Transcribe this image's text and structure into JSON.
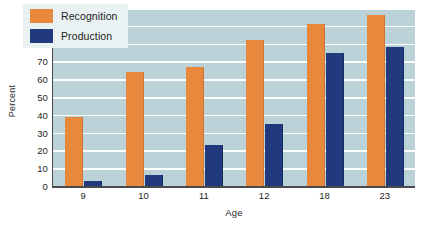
{
  "chart_data": {
    "type": "bar",
    "title": "",
    "xlabel": "Age",
    "ylabel": "Percent",
    "categories": [
      "9",
      "10",
      "11",
      "12",
      "18",
      "23"
    ],
    "series": [
      {
        "name": "Recognition",
        "color": "#e8883c",
        "values": [
          39,
          64,
          67,
          82,
          91,
          96
        ]
      },
      {
        "name": "Production",
        "color": "#21397d",
        "values": [
          3,
          6,
          23,
          35,
          75,
          78
        ]
      }
    ],
    "ylim": [
      0,
      100
    ],
    "yticks": [
      0,
      10,
      20,
      30,
      40,
      50,
      60,
      70,
      80,
      90,
      100
    ],
    "grid": true,
    "legend_position": "top-left",
    "plot_background": "#bcd2d9",
    "gridline_color": "#ffffff"
  }
}
